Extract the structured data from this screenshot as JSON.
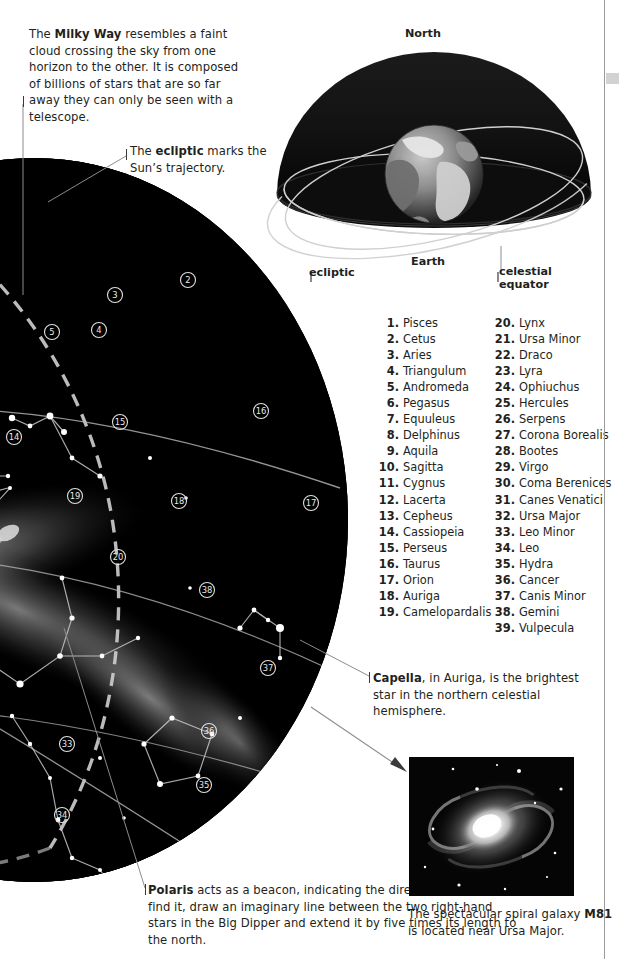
{
  "captions": {
    "milky_way": {
      "lead_bold": "Milky Way",
      "prefix": "The ",
      "text": " resembles a faint cloud crossing the sky from one horizon to the other. It is composed of billions of stars that are so far away they can only be seen with a telescope."
    },
    "ecliptic": {
      "prefix": "The ",
      "lead_bold": "ecliptic",
      "text": " marks the Sun’s trajectory."
    },
    "capella": {
      "lead_bold": "Capella",
      "prefix": "",
      "text": ", in Auriga, is the brightest star in the northern celestial hemisphere."
    },
    "polaris": {
      "lead_bold": "Polaris",
      "prefix": "",
      "text": " acts as a beacon, indicating the direction north. To find it, draw an imaginary line between the two right-hand stars in the Big Dipper and extend it by five times its length to the north."
    },
    "m81": {
      "prefix": "The spectacular spiral galaxy ",
      "lead_bold": "M81",
      "text": " is located near Ursa Major."
    }
  },
  "sphere_diagram": {
    "north_label": "North",
    "earth_label": "Earth",
    "ecliptic_label": "ecliptic",
    "celestial_equator_label": "celestial\nequator"
  },
  "constellation_index": {
    "column_left": [
      {
        "num": "1.",
        "name": "Pisces"
      },
      {
        "num": "2.",
        "name": "Cetus"
      },
      {
        "num": "3.",
        "name": "Aries"
      },
      {
        "num": "4.",
        "name": "Triangulum"
      },
      {
        "num": "5.",
        "name": "Andromeda"
      },
      {
        "num": "6.",
        "name": "Pegasus"
      },
      {
        "num": "7.",
        "name": "Equuleus"
      },
      {
        "num": "8.",
        "name": "Delphinus"
      },
      {
        "num": "9.",
        "name": "Aquila"
      },
      {
        "num": "10.",
        "name": "Sagitta"
      },
      {
        "num": "11.",
        "name": "Cygnus"
      },
      {
        "num": "12.",
        "name": "Lacerta"
      },
      {
        "num": "13.",
        "name": "Cepheus"
      },
      {
        "num": "14.",
        "name": "Cassiopeia"
      },
      {
        "num": "15.",
        "name": "Perseus"
      },
      {
        "num": "16.",
        "name": "Taurus"
      },
      {
        "num": "17.",
        "name": "Orion"
      },
      {
        "num": "18.",
        "name": "Auriga"
      },
      {
        "num": "19.",
        "name": "Camelopardalis"
      }
    ],
    "column_right": [
      {
        "num": "20.",
        "name": "Lynx"
      },
      {
        "num": "21.",
        "name": "Ursa Minor"
      },
      {
        "num": "22.",
        "name": "Draco"
      },
      {
        "num": "23.",
        "name": "Lyra"
      },
      {
        "num": "24.",
        "name": "Ophiuchus"
      },
      {
        "num": "25.",
        "name": "Hercules"
      },
      {
        "num": "26.",
        "name": "Serpens"
      },
      {
        "num": "27.",
        "name": "Corona Borealis"
      },
      {
        "num": "28.",
        "name": "Bootes"
      },
      {
        "num": "29.",
        "name": "Virgo"
      },
      {
        "num": "30.",
        "name": "Coma Berenices"
      },
      {
        "num": "31.",
        "name": "Canes Venatici"
      },
      {
        "num": "32.",
        "name": "Ursa Major"
      },
      {
        "num": "33.",
        "name": "Leo Minor"
      },
      {
        "num": "34.",
        "name": "Leo"
      },
      {
        "num": "35.",
        "name": "Hydra"
      },
      {
        "num": "36.",
        "name": "Cancer"
      },
      {
        "num": "37.",
        "name": "Canis Minor"
      },
      {
        "num": "38.",
        "name": "Gemini"
      },
      {
        "num": "39.",
        "name": "Vulpecula"
      }
    ]
  },
  "star_map": {
    "markers": [
      {
        "label": "2",
        "x": 188,
        "y": 280
      },
      {
        "label": "3",
        "x": 115,
        "y": 295
      },
      {
        "label": "4",
        "x": 99,
        "y": 330
      },
      {
        "label": "5",
        "x": 52,
        "y": 332
      },
      {
        "label": "14",
        "x": 14,
        "y": 437
      },
      {
        "label": "15",
        "x": 120,
        "y": 422
      },
      {
        "label": "16",
        "x": 261,
        "y": 411
      },
      {
        "label": "17",
        "x": 311,
        "y": 503
      },
      {
        "label": "18",
        "x": 179,
        "y": 501
      },
      {
        "label": "19",
        "x": 75,
        "y": 496
      },
      {
        "label": "20",
        "x": 118,
        "y": 557
      },
      {
        "label": "33",
        "x": 67,
        "y": 744
      },
      {
        "label": "34",
        "x": 62,
        "y": 815
      },
      {
        "label": "35",
        "x": 204,
        "y": 785
      },
      {
        "label": "36",
        "x": 209,
        "y": 731
      },
      {
        "label": "37",
        "x": 268,
        "y": 668
      },
      {
        "label": "38",
        "x": 207,
        "y": 590
      }
    ]
  },
  "colors": {
    "ink": "#231f20",
    "rule": "#9a9a9a",
    "tab": "#d2d2d2",
    "sky": "#000000",
    "leader": "#8c8c8c"
  }
}
